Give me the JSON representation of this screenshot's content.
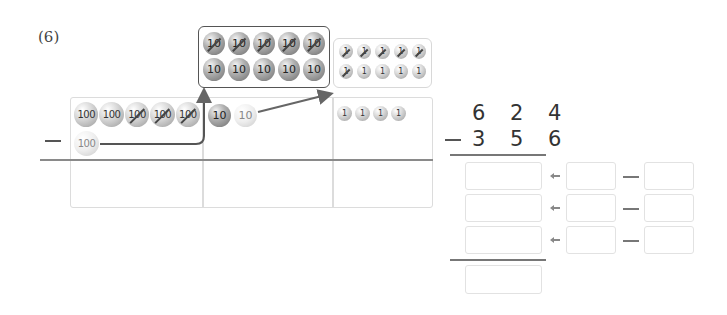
{
  "problem": {
    "number": "(6)"
  },
  "operator": "−",
  "tens_regroup_box": {
    "row1": [
      {
        "label": "10",
        "crossed": true
      },
      {
        "label": "10",
        "crossed": true
      },
      {
        "label": "10",
        "crossed": true
      },
      {
        "label": "10",
        "crossed": true
      },
      {
        "label": "10",
        "crossed": true
      }
    ],
    "row2": [
      {
        "label": "10",
        "crossed": false
      },
      {
        "label": "10",
        "crossed": false
      },
      {
        "label": "10",
        "crossed": false
      },
      {
        "label": "10",
        "crossed": false
      },
      {
        "label": "10",
        "crossed": false
      }
    ]
  },
  "ones_regroup_box": {
    "row1": [
      {
        "label": "1",
        "crossed": true
      },
      {
        "label": "1",
        "crossed": true
      },
      {
        "label": "1",
        "crossed": true
      },
      {
        "label": "1",
        "crossed": true
      },
      {
        "label": "1",
        "crossed": true
      }
    ],
    "row2": [
      {
        "label": "1",
        "crossed": true
      },
      {
        "label": "1",
        "crossed": false
      },
      {
        "label": "1",
        "crossed": false
      },
      {
        "label": "1",
        "crossed": false
      },
      {
        "label": "1",
        "crossed": false
      }
    ]
  },
  "place_value_table": {
    "hundreds": {
      "row1": [
        {
          "label": "100",
          "crossed": false
        },
        {
          "label": "100",
          "crossed": false
        },
        {
          "label": "100",
          "crossed": true
        },
        {
          "label": "100",
          "crossed": true
        },
        {
          "label": "100",
          "crossed": true
        }
      ],
      "row2": [
        {
          "label": "100",
          "crossed": false,
          "faint": true
        }
      ]
    },
    "tens": [
      {
        "label": "10",
        "crossed": false
      },
      {
        "label": "10",
        "crossed": false,
        "faint": true
      }
    ],
    "ones": [
      {
        "label": "1"
      },
      {
        "label": "1"
      },
      {
        "label": "1"
      },
      {
        "label": "1"
      }
    ]
  },
  "vertical_subtraction": {
    "minuend": "6 2 4",
    "subtrahend": "3 5 6",
    "operator": "−"
  },
  "answer_rows": [
    {
      "result": "",
      "left": "",
      "right": ""
    },
    {
      "result": "",
      "left": "",
      "right": ""
    },
    {
      "result": "",
      "left": "",
      "right": ""
    }
  ],
  "final_answer": "",
  "icons": {
    "arrow": "left-arrow-icon",
    "minus": "minus-dash-icon"
  },
  "colors": {
    "box_border": "#555555",
    "light_border": "#dcdcdc",
    "arrow": "#666666",
    "rule": "#8a8a8a"
  }
}
